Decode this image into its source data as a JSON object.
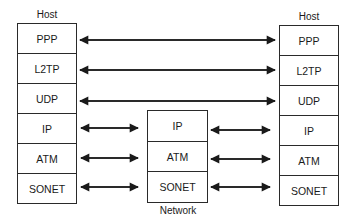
{
  "left_host": {
    "title": "Host",
    "layers": [
      "PPP",
      "L2TP",
      "UDP",
      "IP",
      "ATM",
      "SONET"
    ]
  },
  "network": {
    "title": "Network",
    "layers": [
      "IP",
      "ATM",
      "SONET"
    ]
  },
  "right_host": {
    "title": "Host",
    "layers": [
      "PPP",
      "L2TP",
      "UDP",
      "IP",
      "ATM",
      "SONET"
    ]
  },
  "connections": [
    {
      "from": "left_host.PPP",
      "to": "right_host.PPP",
      "type": "bidirectional"
    },
    {
      "from": "left_host.L2TP",
      "to": "right_host.L2TP",
      "type": "bidirectional"
    },
    {
      "from": "left_host.UDP",
      "to": "right_host.UDP",
      "type": "bidirectional"
    },
    {
      "from": "left_host.IP",
      "to": "network.IP",
      "type": "bidirectional"
    },
    {
      "from": "left_host.ATM",
      "to": "network.ATM",
      "type": "bidirectional"
    },
    {
      "from": "left_host.SONET",
      "to": "network.SONET",
      "type": "bidirectional"
    },
    {
      "from": "network.IP",
      "to": "right_host.IP",
      "type": "bidirectional"
    },
    {
      "from": "network.ATM",
      "to": "right_host.ATM",
      "type": "bidirectional"
    },
    {
      "from": "network.SONET",
      "to": "right_host.SONET",
      "type": "bidirectional"
    }
  ],
  "colors": {
    "line": "#2a2a2a",
    "background": "#ffffff"
  }
}
